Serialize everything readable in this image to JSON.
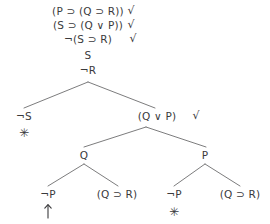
{
  "diagram": {
    "type": "semantic-tableau-truth-tree",
    "background_color": "#ffffff",
    "ink_color": "#3a3a3c",
    "trunk": [
      {
        "id": "trunk-1",
        "text": "(P ⊃ (Q ⊃ R))",
        "x": 88,
        "y": 11,
        "checked": true,
        "check_x": 131,
        "check_y": 10
      },
      {
        "id": "trunk-2",
        "text": "(S ⊃ (Q ∨ P))",
        "x": 88,
        "y": 25,
        "checked": true,
        "check_x": 131,
        "check_y": 24
      },
      {
        "id": "trunk-3",
        "text": "¬(S ⊃ R)",
        "x": 88,
        "y": 39,
        "checked": true,
        "check_x": 133,
        "check_y": 38
      },
      {
        "id": "trunk-4",
        "text": "S",
        "x": 88,
        "y": 55,
        "checked": false,
        "check_x": 0,
        "check_y": 0
      },
      {
        "id": "trunk-5",
        "text": "¬R",
        "x": 88,
        "y": 70,
        "checked": false,
        "check_x": 0,
        "check_y": 0
      }
    ],
    "branch_nodes": [
      {
        "id": "node-not-s",
        "text": "¬S",
        "x": 24,
        "y": 116,
        "checked": false,
        "check_x": 0,
        "check_y": 0
      },
      {
        "id": "node-q-or-p",
        "text": "(Q ∨ P)",
        "x": 157,
        "y": 116,
        "checked": true,
        "check_x": 196,
        "check_y": 115
      },
      {
        "id": "node-q",
        "text": "Q",
        "x": 84,
        "y": 155,
        "checked": false,
        "check_x": 0,
        "check_y": 0
      },
      {
        "id": "node-p",
        "text": "P",
        "x": 205,
        "y": 155,
        "checked": false,
        "check_x": 0,
        "check_y": 0
      },
      {
        "id": "leaf-not-p-left",
        "text": "¬P",
        "x": 48,
        "y": 194,
        "checked": false,
        "check_x": 0,
        "check_y": 0
      },
      {
        "id": "leaf-q-imp-r-left",
        "text": "(Q ⊃ R)",
        "x": 117,
        "y": 194,
        "checked": false,
        "check_x": 0,
        "check_y": 0
      },
      {
        "id": "leaf-not-p-right",
        "text": "¬P",
        "x": 174,
        "y": 194,
        "checked": false,
        "check_x": 0,
        "check_y": 0
      },
      {
        "id": "leaf-q-imp-r-right",
        "text": "(Q ⊃ R)",
        "x": 240,
        "y": 194,
        "checked": false,
        "check_x": 0,
        "check_y": 0
      }
    ],
    "closure_marks": [
      {
        "id": "closed-not-s",
        "glyph": "✳",
        "x": 24,
        "y": 133
      },
      {
        "id": "closed-not-p-right",
        "glyph": "✳",
        "x": 174,
        "y": 212
      }
    ],
    "open_marks": [
      {
        "id": "open-not-p-left",
        "glyph": "↑",
        "x": 48,
        "y": 213
      }
    ],
    "checkmark_glyph": "√",
    "edges": [
      {
        "id": "edge-root-left",
        "x1": 88,
        "y1": 82,
        "x2": 24,
        "y2": 108
      },
      {
        "id": "edge-root-right",
        "x1": 88,
        "y1": 82,
        "x2": 155,
        "y2": 108
      },
      {
        "id": "edge-qorp-left",
        "x1": 146,
        "y1": 127,
        "x2": 84,
        "y2": 147
      },
      {
        "id": "edge-qorp-right",
        "x1": 146,
        "y1": 127,
        "x2": 206,
        "y2": 147
      },
      {
        "id": "edge-q-left",
        "x1": 84,
        "y1": 164,
        "x2": 48,
        "y2": 186
      },
      {
        "id": "edge-q-right",
        "x1": 84,
        "y1": 164,
        "x2": 118,
        "y2": 186
      },
      {
        "id": "edge-p-left",
        "x1": 205,
        "y1": 164,
        "x2": 174,
        "y2": 186
      },
      {
        "id": "edge-p-right",
        "x1": 205,
        "y1": 164,
        "x2": 240,
        "y2": 186
      }
    ]
  }
}
